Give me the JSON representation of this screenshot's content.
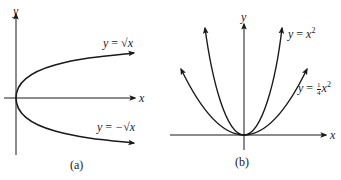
{
  "figure": {
    "panels": [
      {
        "id": "a",
        "caption": "(a)",
        "x_axis_label": "x",
        "y_axis_label": "y",
        "curves": [
          {
            "name": "upper",
            "label_lhs": "y",
            "label_eq": "=",
            "label_rhs": "√x",
            "equation": "y = √x"
          },
          {
            "name": "lower",
            "label_lhs": "y",
            "label_eq": "=",
            "label_rhs": "−√x",
            "equation": "y = −√x"
          }
        ]
      },
      {
        "id": "b",
        "caption": "(b)",
        "x_axis_label": "x",
        "y_axis_label": "y",
        "curves": [
          {
            "name": "steep",
            "label_lhs": "y",
            "label_eq": "=",
            "label_var": "x",
            "label_exp": "2",
            "equation": "y = x^2"
          },
          {
            "name": "wide",
            "label_lhs": "y",
            "label_eq": "=",
            "label_num": "1",
            "label_den": "4",
            "label_var": "x",
            "label_exp": "2",
            "equation": "y = (1/4)x^2"
          }
        ]
      }
    ],
    "colors": {
      "ink": "#1a1a1a",
      "background": "#ffffff"
    }
  }
}
